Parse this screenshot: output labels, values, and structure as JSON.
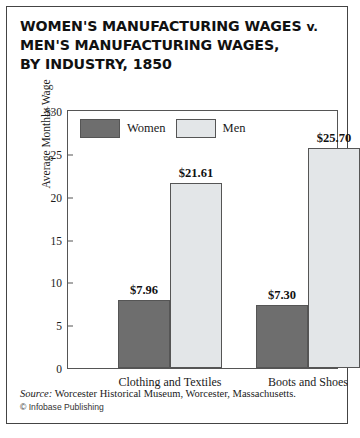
{
  "title": {
    "line1_main": "WOMEN'S MANUFACTURING WAGES",
    "line1_vs": "v.",
    "line2": "MEN'S MANUFACTURING WAGES,",
    "line3": "BY INDUSTRY, 1850"
  },
  "legend": {
    "items": [
      {
        "label": "Women",
        "color": "#6e6e6e"
      },
      {
        "label": "Men",
        "color": "#e3e6e8"
      }
    ]
  },
  "footer": {
    "source_keyword": "Source:",
    "source_text": "Worcester Historical Museum, Worcester, Massachusetts.",
    "copyright": "© Infobase Publishing"
  },
  "chart_data": {
    "type": "bar",
    "title": "WOMEN'S MANUFACTURING WAGES v. MEN'S MANUFACTURING WAGES, BY INDUSTRY, 1850",
    "xlabel": "",
    "ylabel": "Average Monthly Wage",
    "categories": [
      "Clothing and Textiles",
      "Boots and Shoes"
    ],
    "series": [
      {
        "name": "Women",
        "color": "#6e6e6e",
        "values": [
          7.96,
          7.3
        ],
        "labels": [
          "$7.96",
          "$7.30"
        ]
      },
      {
        "name": "Men",
        "color": "#e3e6e8",
        "values": [
          21.61,
          25.7
        ],
        "labels": [
          "$21.61",
          "$25.70"
        ]
      }
    ],
    "ylim": [
      0,
      30
    ],
    "yticks": [
      0,
      5,
      10,
      15,
      20,
      25,
      30
    ],
    "ytick_labels": [
      "0",
      "5",
      "10",
      "15",
      "20",
      "25",
      "$30"
    ],
    "grid": false,
    "legend_position": "top-left-inside"
  }
}
